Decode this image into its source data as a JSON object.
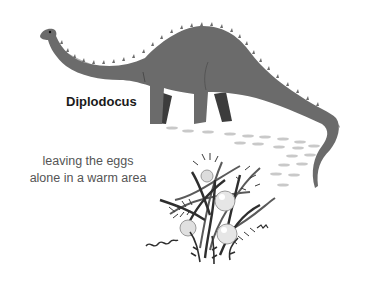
{
  "labels": {
    "title": "Diplodocus",
    "caption_line1": "leaving the eggs",
    "caption_line2": "alone in a warm area"
  },
  "illustration": {
    "subject": "diplodocus-dinosaur",
    "secondary": "nest-with-eggs-in-ferns",
    "footprints": "footprint-trail",
    "colors": {
      "body": "#6b6b6b",
      "belly": "#b5b5b5",
      "dark_leg": "#3c3c3c",
      "footprint": "#c9c9c9",
      "fern_dark": "#2e2e2e",
      "fern_mid": "#5a5a5a",
      "egg": "#e6e6e6"
    }
  }
}
